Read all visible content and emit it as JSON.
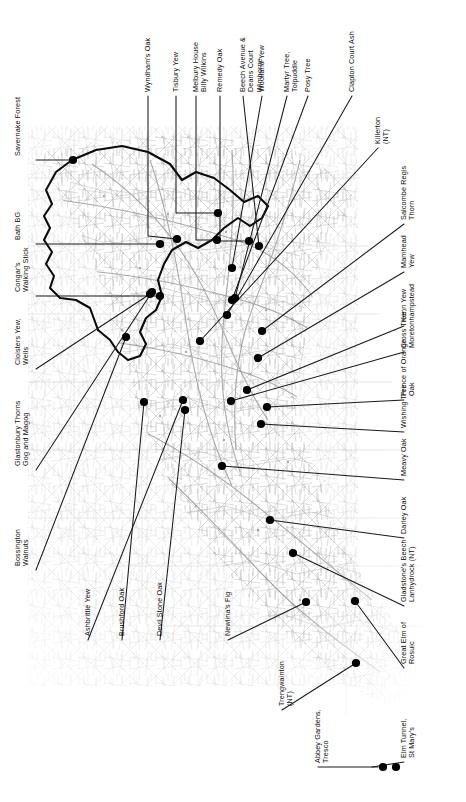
{
  "figure": {
    "type": "annotated-map",
    "region": "South West England",
    "inset_name": "Isles of Scilly",
    "map_style": "faded grayscale road and topographic base map with bold county/region outline",
    "marker_color": "#000000",
    "leader_color": "#1a1a1a",
    "background_color": "#ffffff",
    "base_map_color": "#9a9a9a",
    "outline_color": "#000000"
  },
  "labels": {
    "top": [
      {
        "id": "wyndhams-oak",
        "text": "Wyndham's Oak",
        "lines": [
          "Wyndham's Oak"
        ]
      },
      {
        "id": "tisbury-yew",
        "text": "Tisbury Yew",
        "lines": [
          "Tisbury Yew"
        ]
      },
      {
        "id": "melbury-house",
        "text": "Melbury House Billy Wilkins",
        "lines": [
          "Melbury House",
          "Billy Wilkins"
        ]
      },
      {
        "id": "remedy-oak",
        "text": "Remedy Oak",
        "lines": [
          "Remedy Oak"
        ]
      },
      {
        "id": "beech-avenue",
        "text": "Beech Avenue & Deans Court Wimborne",
        "lines": [
          "Beech Avenue &",
          "Deans Court",
          "Wimborne"
        ]
      },
      {
        "id": "woolland-yew",
        "text": "Woolland Yew",
        "lines": [
          "Woolland Yew"
        ]
      },
      {
        "id": "martyr-tree",
        "text": "Martyr Tree, Tolpuddle",
        "lines": [
          "Martyr Tree,",
          "Tolpuddle"
        ]
      },
      {
        "id": "posy-tree",
        "text": "Posy Tree",
        "lines": [
          "Posy Tree"
        ]
      },
      {
        "id": "clapton-court-ash",
        "text": "Clapton Court Ash",
        "lines": [
          "Clapton Court Ash"
        ]
      }
    ],
    "right": [
      {
        "id": "killerton",
        "text": "Killerton (NT)",
        "lines": [
          "Killerton",
          "(NT)"
        ]
      },
      {
        "id": "salcombe-regis",
        "text": "Salcombe Regis Thorn",
        "lines": [
          "Salcombe Regis",
          "Thorn"
        ]
      },
      {
        "id": "mamhead-yew",
        "text": "Mamhead Yew",
        "lines": [
          "Mamhead",
          "Yew"
        ]
      },
      {
        "id": "kenn-yew",
        "text": "Kenn Yew",
        "lines": [
          "Kenn Yew"
        ]
      },
      {
        "id": "cross-tree",
        "text": "Cross Tree, Moretonhampstead",
        "lines": [
          "Cross Tree,",
          "Moretonhampstead"
        ]
      },
      {
        "id": "prince-of-orange",
        "text": "Prince of Orange Oak",
        "lines": [
          "Prince of Orange",
          "Oak"
        ]
      },
      {
        "id": "wishing-tree",
        "text": "Wishing Tree",
        "lines": [
          "Wishing Tree"
        ]
      },
      {
        "id": "meavy-oak",
        "text": "Meavy Oak",
        "lines": [
          "Meavy Oak"
        ]
      },
      {
        "id": "darley-oak",
        "text": "Darley Oak",
        "lines": [
          "Darley Oak"
        ]
      },
      {
        "id": "gladstones-beech",
        "text": "Gladstone's Beech Lanhydrock (NT)",
        "lines": [
          "Gladstone's Beech",
          "Lanhydrock (NT)"
        ]
      },
      {
        "id": "great-elm-rosuic",
        "text": "Great Elm of Rosuic",
        "lines": [
          "Great Elm of",
          "Rosuic"
        ]
      },
      {
        "id": "elm-tunnel",
        "text": "Elm Tunnel, St Mary's",
        "lines": [
          "Elm Tunnel,",
          "St Mary's"
        ]
      }
    ],
    "left": [
      {
        "id": "savernake-forest",
        "text": "Savernake Forest",
        "lines": [
          "Savernake Forest"
        ]
      },
      {
        "id": "bath-bg",
        "text": "Bath BG",
        "lines": [
          "Bath BG"
        ]
      },
      {
        "id": "congars-walking-stick",
        "text": "Congar's Walking Stick",
        "lines": [
          "Congar's",
          "Walking Stick"
        ]
      },
      {
        "id": "cloisters-yew",
        "text": "Cloisters Yew, Wells",
        "lines": [
          "Cloisters Yew,",
          "Wells"
        ]
      },
      {
        "id": "glastonbury-thorns",
        "text": "Glastonbury Thorns Gog and Magog",
        "lines": [
          "Glastonbury Thorns",
          "Gog and Magog"
        ]
      },
      {
        "id": "bossington-walnuts",
        "text": "Bossington Walnuts",
        "lines": [
          "Bossington",
          "Walnuts"
        ]
      }
    ],
    "bottom": [
      {
        "id": "ashbrittle-yew",
        "text": "Ashbrittle Yew",
        "lines": [
          "Ashbrittle Yew"
        ]
      },
      {
        "id": "brushford-oak",
        "text": "Brushford Oak",
        "lines": [
          "Brushford Oak"
        ]
      },
      {
        "id": "devil-stone-oak",
        "text": "Devil Stone Oak",
        "lines": [
          "Devil Stone Oak"
        ]
      },
      {
        "id": "newlinas-fig",
        "text": "Newlina's Fig",
        "lines": [
          "Newlina's Fig"
        ]
      },
      {
        "id": "trengwainton",
        "text": "Trengwainton (NT)",
        "lines": [
          "Trengwainton",
          "(NT)"
        ]
      },
      {
        "id": "abbey-gardens",
        "text": "Abbey Gardens, Tresco",
        "lines": [
          "Abbey Gardens,",
          "Tresco"
        ]
      }
    ]
  },
  "markers": [
    {
      "id": "savernake-forest",
      "x": 73,
      "y": 160
    },
    {
      "id": "bath-bg",
      "x": 160,
      "y": 244
    },
    {
      "id": "congars-walking-stick",
      "x": 160,
      "y": 296
    },
    {
      "id": "cloisters-yew",
      "x": 150,
      "y": 294
    },
    {
      "id": "glastonbury-thorns",
      "x": 152,
      "y": 292
    },
    {
      "id": "bossington-walnuts",
      "x": 126,
      "y": 337
    },
    {
      "id": "wyndhams-oak",
      "x": 177,
      "y": 239
    },
    {
      "id": "tisbury-yew",
      "x": 218,
      "y": 213
    },
    {
      "id": "melbury-house",
      "x": 217,
      "y": 240
    },
    {
      "id": "remedy-oak",
      "x": 249,
      "y": 241
    },
    {
      "id": "beech-avenue",
      "x": 259,
      "y": 246
    },
    {
      "id": "woolland-yew",
      "x": 232,
      "y": 268
    },
    {
      "id": "martyr-tree",
      "x": 235,
      "y": 298
    },
    {
      "id": "posy-tree",
      "x": 232,
      "y": 300
    },
    {
      "id": "clapton-court-ash",
      "x": 227,
      "y": 315
    },
    {
      "id": "killerton",
      "x": 200,
      "y": 341
    },
    {
      "id": "salcombe-regis",
      "x": 262,
      "y": 331
    },
    {
      "id": "mamhead-yew",
      "x": 258,
      "y": 358
    },
    {
      "id": "kenn-yew",
      "x": 247,
      "y": 390
    },
    {
      "id": "cross-tree",
      "x": 231,
      "y": 401
    },
    {
      "id": "prince-of-orange",
      "x": 267,
      "y": 407
    },
    {
      "id": "wishing-tree",
      "x": 261,
      "y": 424
    },
    {
      "id": "meavy-oak",
      "x": 222,
      "y": 466
    },
    {
      "id": "darley-oak",
      "x": 270,
      "y": 520
    },
    {
      "id": "ashbrittle-yew",
      "x": 183,
      "y": 400
    },
    {
      "id": "brushford-oak",
      "x": 144,
      "y": 402
    },
    {
      "id": "devil-stone-oak",
      "x": 185,
      "y": 410
    },
    {
      "id": "gladstones-beech",
      "x": 293,
      "y": 553
    },
    {
      "id": "newlinas-fig",
      "x": 306,
      "y": 602
    },
    {
      "id": "great-elm-rosuic",
      "x": 355,
      "y": 601
    },
    {
      "id": "trengwainton",
      "x": 356,
      "y": 663
    },
    {
      "id": "abbey-gardens",
      "x": 383,
      "y": 767
    },
    {
      "id": "elm-tunnel",
      "x": 396,
      "y": 767
    }
  ],
  "leaders": [
    {
      "id": "savernake-forest",
      "path": "M 36 160 L 73 160"
    },
    {
      "id": "bath-bg",
      "path": "M 36 244 L 160 244"
    },
    {
      "id": "congars-walking-stick",
      "path": "M 36 296 L 160 296"
    },
    {
      "id": "cloisters-yew",
      "path": "M 36 369 L 150 294"
    },
    {
      "id": "glastonbury-thorns",
      "path": "M 36 470 L 152 292"
    },
    {
      "id": "bossington-walnuts",
      "path": "M 36 570 L 126 337"
    },
    {
      "id": "wyndhams-oak",
      "path": "M 148 96 L 148 236 L 177 239"
    },
    {
      "id": "tisbury-yew",
      "path": "M 176 96 L 176 213 L 218 213"
    },
    {
      "id": "melbury-house",
      "path": "M 196 96 L 196 240 L 217 240"
    },
    {
      "id": "remedy-oak",
      "path": "M 220 96 L 220 241 L 249 241"
    },
    {
      "id": "beech-avenue",
      "path": "M 243 96 L 259 246"
    },
    {
      "id": "woolland-yew",
      "path": "M 262 96 L 232 268"
    },
    {
      "id": "martyr-tree",
      "path": "M 287 96 L 235 298"
    },
    {
      "id": "posy-tree",
      "path": "M 308 96 L 232 300"
    },
    {
      "id": "clapton-court-ash",
      "path": "M 352 96 L 227 315"
    },
    {
      "id": "killerton",
      "path": "M 378 148 L 200 341"
    },
    {
      "id": "salcombe-regis",
      "path": "M 404 224 L 262 331"
    },
    {
      "id": "mamhead-yew",
      "path": "M 404 272 L 258 358"
    },
    {
      "id": "kenn-yew",
      "path": "M 404 326 L 247 390"
    },
    {
      "id": "cross-tree",
      "path": "M 404 352 L 231 401"
    },
    {
      "id": "prince-of-orange",
      "path": "M 404 400 L 267 407"
    },
    {
      "id": "wishing-tree",
      "path": "M 404 432 L 261 424"
    },
    {
      "id": "meavy-oak",
      "path": "M 404 480 L 222 466"
    },
    {
      "id": "darley-oak",
      "path": "M 404 538 L 270 520"
    },
    {
      "id": "gladstones-beech",
      "path": "M 404 606 L 293 553"
    },
    {
      "id": "great-elm-rosuic",
      "path": "M 404 668 L 355 601"
    },
    {
      "id": "elm-tunnel",
      "path": "M 404 762 L 372 767"
    },
    {
      "id": "ashbrittle-yew",
      "path": "M 88 640 L 183 400"
    },
    {
      "id": "brushford-oak",
      "path": "M 122 640 L 144 402"
    },
    {
      "id": "devil-stone-oak",
      "path": "M 160 640 L 185 410"
    },
    {
      "id": "newlinas-fig",
      "path": "M 228 640 L 306 602"
    },
    {
      "id": "trengwainton",
      "path": "M 282 710 L 356 663"
    },
    {
      "id": "abbey-gardens",
      "path": "M 318 767 L 378 767"
    }
  ]
}
